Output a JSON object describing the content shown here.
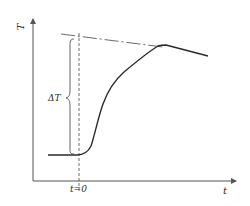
{
  "diagram": {
    "type": "temperature-rise-response",
    "axes": {
      "y_label": "T",
      "x_label": "t",
      "origin_marker_label": "t=0"
    },
    "annotations": {
      "delta_label": "ΔT"
    },
    "elements": [
      {
        "id": "y-axis",
        "kind": "arrow",
        "description": "vertical temperature axis"
      },
      {
        "id": "x-axis",
        "kind": "arrow",
        "description": "horizontal time axis"
      },
      {
        "id": "t0-line",
        "kind": "dashed-line",
        "description": "vertical dashed line at t=0"
      },
      {
        "id": "asymptote",
        "kind": "dash-dot-line",
        "description": "sloped reference line extrapolated back to t=0"
      },
      {
        "id": "response-curve",
        "kind": "curve",
        "description": "flat baseline, steep rise after t=0, then slowly decreasing plateau"
      },
      {
        "id": "delta-brace",
        "kind": "brace",
        "description": "curly brace spanning baseline to extrapolated line at t=0"
      }
    ],
    "colors": {
      "stroke": "#2a2a2a",
      "axis": "#555555",
      "background": "#ffffff"
    }
  }
}
